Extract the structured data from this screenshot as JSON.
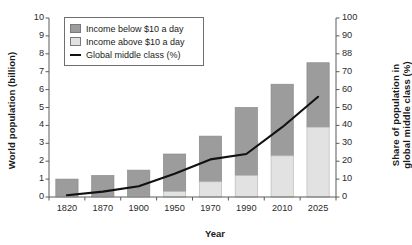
{
  "chart_data": {
    "type": "bar",
    "title": "",
    "subtitle": "",
    "xlabel": "Year",
    "ylabel": "World population (billion)",
    "y2label": "Share of population in global middle class (%)",
    "categories": [
      "1820",
      "1870",
      "1900",
      "1950",
      "1970",
      "1990",
      "2010",
      "2025"
    ],
    "ylim": [
      0,
      10
    ],
    "y2lim": [
      0,
      100
    ],
    "yticks": [
      "0",
      "1",
      "2",
      "3",
      "4",
      "5",
      "6",
      "7",
      "8",
      "9",
      "10"
    ],
    "y2ticks": [
      "0",
      "10",
      "20",
      "30",
      "40",
      "50",
      "60",
      "70",
      "88",
      "90",
      "100"
    ],
    "grid": false,
    "stacked": true,
    "legend_position": "top-left",
    "series": [
      {
        "name": "Income above $10 a day",
        "type": "bar",
        "axis": "left",
        "color": "#e2e2e2",
        "values": [
          0.02,
          0.03,
          0.05,
          0.3,
          0.85,
          1.2,
          2.3,
          3.9
        ]
      },
      {
        "name": "Income below $10 a day",
        "type": "bar",
        "axis": "left",
        "color": "#9c9c9c",
        "values": [
          0.98,
          1.17,
          1.45,
          2.1,
          2.55,
          3.8,
          4.0,
          3.6
        ]
      },
      {
        "name": "Global middle class (%)",
        "type": "line",
        "axis": "right",
        "color": "#111111",
        "values": [
          1,
          3,
          6,
          13,
          21,
          24,
          39,
          56
        ]
      }
    ],
    "bar_totals": [
      1.0,
      1.2,
      1.5,
      2.4,
      3.4,
      5.0,
      6.3,
      7.5
    ]
  },
  "legend": {
    "items": [
      {
        "label": "Income below $10 a day",
        "marker": "dark-swatch"
      },
      {
        "label": "Income above $10 a day",
        "marker": "light-swatch"
      },
      {
        "label": "Global middle class (%)",
        "marker": "line-swatch"
      }
    ]
  },
  "axes": {
    "left_title": "World population (billion)",
    "right_title_line1": "Share of population in",
    "right_title_line2": "global middle class (%)",
    "x_title": "Year"
  }
}
